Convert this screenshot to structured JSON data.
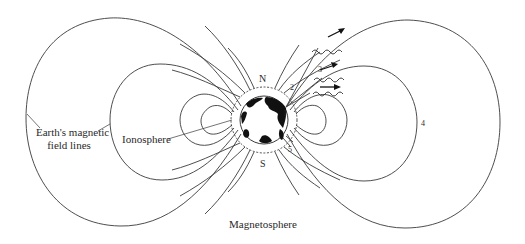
{
  "diagram": {
    "title": "Magnetosphere",
    "labels": {
      "field_lines": [
        "Earth's magnetic",
        "field lines"
      ],
      "ionosphere": "Ionosphere",
      "north": "N",
      "south": "S",
      "num_1": "1",
      "num_2": "2",
      "num_3": "3",
      "num_4": "4",
      "num_5": "5"
    },
    "elements": {
      "earth": "earth-globe",
      "ionosphere_ring": "dashed ring around Earth",
      "wave_arrows": 3,
      "field_line_loops": [
        "outer-left",
        "middle-left",
        "inner-left",
        "outer-right",
        "middle-right",
        "inner-right"
      ]
    },
    "colors": {
      "line": "#3a3a3a",
      "land": "#111111",
      "background": "#ffffff"
    }
  }
}
